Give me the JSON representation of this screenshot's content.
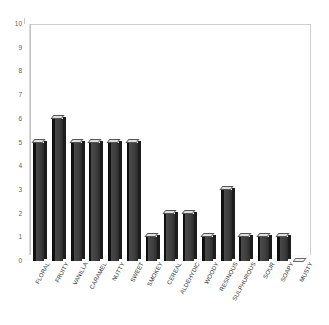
{
  "chart_data": {
    "type": "bar",
    "title": "",
    "subtitle": "",
    "xlabel": "",
    "ylabel": "",
    "ylim": [
      0,
      10
    ],
    "ytick_step": 1,
    "yticks": [
      "10",
      "9",
      "8",
      "7",
      "6",
      "5",
      "4",
      "3",
      "2",
      "1",
      "0"
    ],
    "grid": false,
    "legend": "none",
    "style": "3d-column",
    "bar_color": "#3a3a3a",
    "plot_background": "#ffffff",
    "frame_color": "#c4c4c4",
    "categories": [
      "FLORAL",
      "FRUITY",
      "VANILLA",
      "CARAMEL",
      "NUTTY",
      "SWEET",
      "SMOKEY",
      "CEREAL",
      "ALDEHYDIC",
      "WOODY",
      "RESINOUS",
      "SULPHUROUS",
      "SOUR",
      "SOAPY",
      "MUSTY"
    ],
    "values": [
      5,
      6,
      5,
      5,
      5,
      5,
      1,
      2,
      2,
      1,
      3,
      1,
      1,
      1,
      0
    ]
  }
}
